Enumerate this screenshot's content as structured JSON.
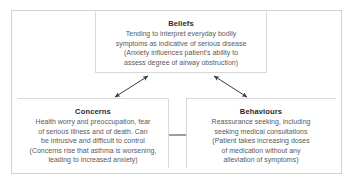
{
  "figure": {
    "type": "cyclical-three-node-diagram",
    "frame_color": "#d2d2d2",
    "box_border_color": "#d8d8d8",
    "text_color": "#5a5a5a",
    "heading_color": "#2b2b2b",
    "arrow_color": "#3a3a3a",
    "background": "#ffffff"
  },
  "nodes": {
    "beliefs": {
      "title": "Beliefs",
      "lines": [
        "Tending to interpret everyday bodily",
        "symptoms as indicative of serious disease",
        "(Anxiety influences patient's ability to",
        "assess degree of airway obstruction)"
      ]
    },
    "concerns": {
      "title": "Concerns",
      "lines": [
        "Health worry and preoccupation, fear",
        "of serious illness and of death. Can",
        "be intrusive and difficult to control",
        "(Concerns rise that asthma is worsening,",
        "leading to increased anxiety)"
      ]
    },
    "behaviours": {
      "title": "Behaviours",
      "lines": [
        "Reassurance seeking, including",
        "seeking medical consultations",
        "(Patient takes increasing doses",
        "of medication without any",
        "alleviation of symptoms)"
      ]
    }
  },
  "connectors": [
    {
      "id": "beliefs-concerns",
      "from": "beliefs",
      "to": "concerns",
      "style": "double-headed-arrow",
      "orientation": "diagonal-left"
    },
    {
      "id": "beliefs-behaviours",
      "from": "beliefs",
      "to": "behaviours",
      "style": "double-headed-arrow",
      "orientation": "diagonal-right"
    },
    {
      "id": "concerns-behaviours",
      "from": "concerns",
      "to": "behaviours",
      "style": "double-headed-arrow",
      "orientation": "horizontal"
    }
  ]
}
